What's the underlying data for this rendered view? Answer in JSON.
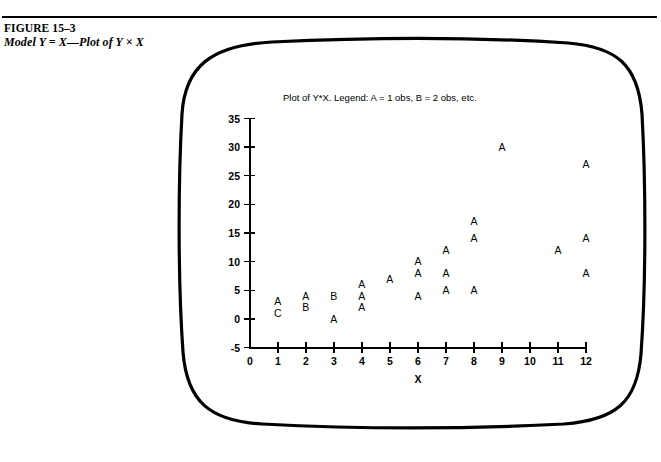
{
  "figure": {
    "number": "FIGURE 15–3",
    "subtitle": "Model Y = X—Plot of Y × X"
  },
  "chart_data": {
    "type": "scatter",
    "title": "Plot of Y*X. Legend: A = 1 obs, B = 2 obs, etc.",
    "xlabel": "X",
    "ylabel": "",
    "xlim": [
      0,
      12
    ],
    "ylim": [
      -5,
      35
    ],
    "grid": false,
    "legend": "A = 1 obs, B = 2 obs, etc.",
    "legend_position": "in-title",
    "x_ticks": [
      "0",
      "1",
      "2",
      "3",
      "4",
      "5",
      "6",
      "7",
      "8",
      "9",
      "10",
      "11",
      "12"
    ],
    "y_ticks": [
      "35",
      "30",
      "25",
      "20",
      "15",
      "10",
      "5",
      "0",
      "-5"
    ],
    "marker_style": "letter-coded-count",
    "points": [
      {
        "x": 1,
        "y": 3,
        "label": "A",
        "count": 1
      },
      {
        "x": 1,
        "y": 1,
        "label": "C",
        "count": 3
      },
      {
        "x": 2,
        "y": 4,
        "label": "A",
        "count": 1
      },
      {
        "x": 2,
        "y": 2,
        "label": "B",
        "count": 2
      },
      {
        "x": 3,
        "y": 4,
        "label": "B",
        "count": 2
      },
      {
        "x": 3,
        "y": 0,
        "label": "A",
        "count": 1
      },
      {
        "x": 4,
        "y": 6,
        "label": "A",
        "count": 1
      },
      {
        "x": 4,
        "y": 4,
        "label": "A",
        "count": 1
      },
      {
        "x": 4,
        "y": 2,
        "label": "A",
        "count": 1
      },
      {
        "x": 5,
        "y": 7,
        "label": "A",
        "count": 1
      },
      {
        "x": 6,
        "y": 10,
        "label": "A",
        "count": 1
      },
      {
        "x": 6,
        "y": 8,
        "label": "A",
        "count": 1
      },
      {
        "x": 6,
        "y": 4,
        "label": "A",
        "count": 1
      },
      {
        "x": 7,
        "y": 12,
        "label": "A",
        "count": 1
      },
      {
        "x": 7,
        "y": 8,
        "label": "A",
        "count": 1
      },
      {
        "x": 7,
        "y": 5,
        "label": "A",
        "count": 1
      },
      {
        "x": 8,
        "y": 17,
        "label": "A",
        "count": 1
      },
      {
        "x": 8,
        "y": 14,
        "label": "A",
        "count": 1
      },
      {
        "x": 8,
        "y": 5,
        "label": "A",
        "count": 1
      },
      {
        "x": 9,
        "y": 30,
        "label": "A",
        "count": 1
      },
      {
        "x": 11,
        "y": 12,
        "label": "A",
        "count": 1
      },
      {
        "x": 12,
        "y": 27,
        "label": "A",
        "count": 1
      },
      {
        "x": 12,
        "y": 14,
        "label": "A",
        "count": 1
      },
      {
        "x": 12,
        "y": 8,
        "label": "A",
        "count": 1
      }
    ]
  },
  "colors": {
    "ink": "#000000",
    "background": "#ffffff"
  }
}
